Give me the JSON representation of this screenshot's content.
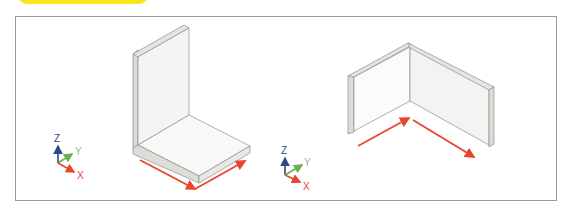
{
  "banner": {
    "color": "#f7e51e"
  },
  "frame": {
    "border_color": "#9a9a9a"
  },
  "colors": {
    "axis_x": "#e8452c",
    "axis_y": "#6ab04c",
    "axis_z": "#2c4a8a",
    "dimension_arrow": "#e8452c",
    "face_light": "#f7f7f5",
    "face_mid": "#efefec",
    "face_edge": "#dcdcd8",
    "outline": "#8c8c8c"
  },
  "figures": [
    {
      "id": "l-bracket",
      "axis_triad": {
        "labels": {
          "x": "X",
          "y": "Y",
          "z": "Z"
        }
      },
      "shape": "L-shaped bracket (vertical wall with floor slab)",
      "dimension_arrows": 2
    },
    {
      "id": "corner-wall",
      "axis_triad": {
        "labels": {
          "x": "X",
          "y": "Y",
          "z": "Z"
        }
      },
      "shape": "Corner wall (two perpendicular walls)",
      "dimension_arrows": 2
    }
  ]
}
